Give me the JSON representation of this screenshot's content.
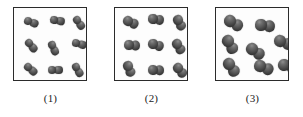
{
  "figure": {
    "type": "molecular-diagram",
    "panel_count": 3,
    "colors": {
      "box_border": "#2b2b2b",
      "box_fill": "#fdfdfd",
      "atom_dark": "#333333",
      "atom_light": "#8e8e8e",
      "caption_text": "#1b1b1b",
      "background": "#ffffff"
    }
  },
  "panels": [
    {
      "id": "panel-1",
      "caption": "(1)",
      "molecule_count": 9,
      "atom_radius": 4.4,
      "molecules": [
        {
          "x": 14,
          "y": 13,
          "angle": 20
        },
        {
          "x": 40,
          "y": 12,
          "angle": 10
        },
        {
          "x": 63,
          "y": 12,
          "angle": 55
        },
        {
          "x": 15,
          "y": 35,
          "angle": 50
        },
        {
          "x": 38,
          "y": 37,
          "angle": 65
        },
        {
          "x": 62,
          "y": 35,
          "angle": 15
        },
        {
          "x": 14,
          "y": 59,
          "angle": 40
        },
        {
          "x": 38,
          "y": 62,
          "angle": 0
        },
        {
          "x": 62,
          "y": 59,
          "angle": 60
        }
      ]
    },
    {
      "id": "panel-2",
      "caption": "(2)",
      "molecule_count": 9,
      "atom_radius": 4.6,
      "molecules": [
        {
          "x": 13,
          "y": 13,
          "angle": 25
        },
        {
          "x": 38,
          "y": 11,
          "angle": 8
        },
        {
          "x": 63,
          "y": 12,
          "angle": 62
        },
        {
          "x": 14,
          "y": 37,
          "angle": 5
        },
        {
          "x": 38,
          "y": 36,
          "angle": 18
        },
        {
          "x": 62,
          "y": 36,
          "angle": 58
        },
        {
          "x": 13,
          "y": 58,
          "angle": 68
        },
        {
          "x": 38,
          "y": 62,
          "angle": 2
        },
        {
          "x": 63,
          "y": 60,
          "angle": 50
        }
      ]
    },
    {
      "id": "panel-3",
      "caption": "(3)",
      "molecule_count": 8,
      "atom_radius": 5.6,
      "molecules": [
        {
          "x": 14,
          "y": 13,
          "angle": 30
        },
        {
          "x": 45,
          "y": 17,
          "angle": 8
        },
        {
          "x": 12,
          "y": 33,
          "angle": 60
        },
        {
          "x": 36,
          "y": 41,
          "angle": 35
        },
        {
          "x": 64,
          "y": 33,
          "angle": 20
        },
        {
          "x": 13,
          "y": 56,
          "angle": 55
        },
        {
          "x": 44,
          "y": 58,
          "angle": 22
        },
        {
          "x": 68,
          "y": 57,
          "angle": 15
        }
      ]
    }
  ]
}
